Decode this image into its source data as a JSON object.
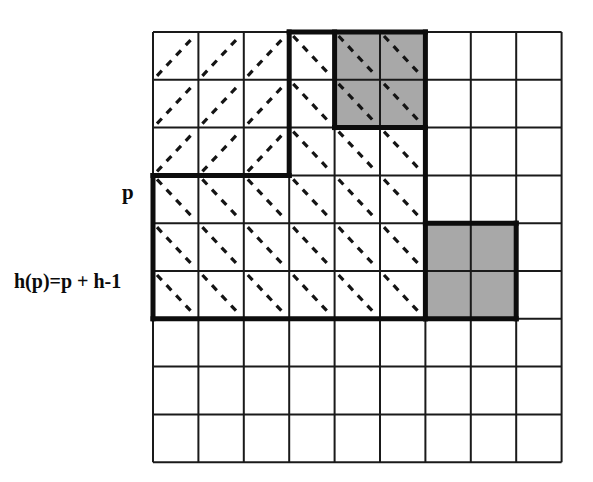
{
  "figure": {
    "labels": {
      "p": "p",
      "hp": "h(p)=p + h-1"
    },
    "colors": {
      "background": "#ffffff",
      "grid_line": "#1a1a1a",
      "thick_line": "#0d0d0d",
      "shaded_cell": "#a8a8a8",
      "dashed_diagonal": "#141414",
      "text": "#0b0b0b"
    },
    "grid": {
      "columns": 9,
      "rows": 9,
      "origin_x": 153,
      "origin_y": 32,
      "cell_width": 45.4,
      "cell_height": 47.8,
      "thin_stroke": 2,
      "thick_stroke": 5
    },
    "shaded_cells": [
      {
        "col": 4,
        "row": 0
      },
      {
        "col": 5,
        "row": 0
      },
      {
        "col": 4,
        "row": 1
      },
      {
        "col": 5,
        "row": 1
      },
      {
        "col": 6,
        "row": 4
      },
      {
        "col": 7,
        "row": 4
      },
      {
        "col": 6,
        "row": 5
      },
      {
        "col": 7,
        "row": 5
      }
    ],
    "diagonals_forward": [
      {
        "col": 0,
        "row": 0
      },
      {
        "col": 1,
        "row": 0
      },
      {
        "col": 2,
        "row": 0
      },
      {
        "col": 0,
        "row": 1
      },
      {
        "col": 1,
        "row": 1
      },
      {
        "col": 2,
        "row": 1
      },
      {
        "col": 0,
        "row": 2
      },
      {
        "col": 1,
        "row": 2
      },
      {
        "col": 2,
        "row": 2
      }
    ],
    "diagonals_backward": [
      {
        "col": 3,
        "row": 0
      },
      {
        "col": 4,
        "row": 0
      },
      {
        "col": 5,
        "row": 0
      },
      {
        "col": 3,
        "row": 1
      },
      {
        "col": 4,
        "row": 1
      },
      {
        "col": 5,
        "row": 1
      },
      {
        "col": 3,
        "row": 2
      },
      {
        "col": 4,
        "row": 2
      },
      {
        "col": 5,
        "row": 2
      },
      {
        "col": 0,
        "row": 3
      },
      {
        "col": 1,
        "row": 3
      },
      {
        "col": 2,
        "row": 3
      },
      {
        "col": 3,
        "row": 3
      },
      {
        "col": 4,
        "row": 3
      },
      {
        "col": 5,
        "row": 3
      },
      {
        "col": 0,
        "row": 4
      },
      {
        "col": 1,
        "row": 4
      },
      {
        "col": 2,
        "row": 4
      },
      {
        "col": 3,
        "row": 4
      },
      {
        "col": 4,
        "row": 4
      },
      {
        "col": 5,
        "row": 4
      },
      {
        "col": 0,
        "row": 5
      },
      {
        "col": 1,
        "row": 5
      },
      {
        "col": 2,
        "row": 5
      },
      {
        "col": 3,
        "row": 5
      },
      {
        "col": 4,
        "row": 5
      },
      {
        "col": 5,
        "row": 5
      }
    ],
    "thick_outline_segments": [
      {
        "name": "top-left-of-p-region",
        "x1": 153,
        "y1": 175.4,
        "x2": 289.2,
        "y2": 175.4
      },
      {
        "name": "vertical-col3-top",
        "x1": 289.2,
        "y1": 32,
        "x2": 289.2,
        "y2": 175.4
      },
      {
        "name": "top-edge-upper-block",
        "x1": 289.2,
        "y1": 32,
        "x2": 425.4,
        "y2": 32
      },
      {
        "name": "vertical-col6-shaded-right",
        "x1": 425.4,
        "y1": 32,
        "x2": 425.4,
        "y2": 318.8
      },
      {
        "name": "shaded-top-block-bottom",
        "x1": 334.6,
        "y1": 127.6,
        "x2": 425.4,
        "y2": 127.6
      },
      {
        "name": "shaded-top-block-left",
        "x1": 334.6,
        "y1": 32,
        "x2": 334.6,
        "y2": 127.6
      },
      {
        "name": "p-region-left",
        "x1": 153,
        "y1": 175.4,
        "x2": 153,
        "y2": 318.8
      },
      {
        "name": "p-region-bottom",
        "x1": 153,
        "y1": 318.8,
        "x2": 425.4,
        "y2": 318.8
      },
      {
        "name": "lower-shaded-top",
        "x1": 425.4,
        "y1": 223.2,
        "x2": 516.2,
        "y2": 223.2
      },
      {
        "name": "lower-shaded-right",
        "x1": 516.2,
        "y1": 223.2,
        "x2": 516.2,
        "y2": 318.8
      },
      {
        "name": "lower-shaded-bottom",
        "x1": 425.4,
        "y1": 318.8,
        "x2": 516.2,
        "y2": 318.8
      }
    ]
  }
}
